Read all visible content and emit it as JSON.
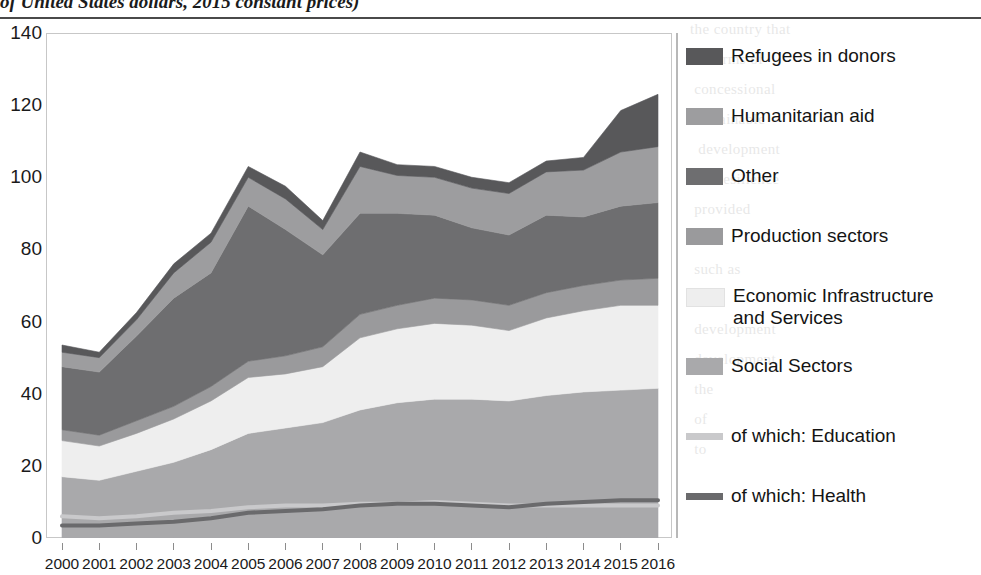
{
  "title": {
    "text": "of United States dollars, 2015 constant prices)",
    "note": "top of title cropped by screenshot edge"
  },
  "axes": {
    "y_ticks": [
      "0",
      "20",
      "40",
      "60",
      "80",
      "100",
      "120",
      "140"
    ],
    "x_ticks": [
      "2000",
      "2001",
      "2002",
      "2003",
      "2004",
      "2005",
      "2006",
      "2007",
      "2008",
      "2009",
      "2010",
      "2011",
      "2012",
      "2013",
      "2014",
      "2015",
      "2016"
    ]
  },
  "legend": {
    "items": [
      {
        "label": "Refugees in donors",
        "type": "area",
        "color": "#58585a"
      },
      {
        "label": "Humanitarian aid",
        "type": "area",
        "color": "#9d9d9f"
      },
      {
        "label": "Other",
        "type": "area",
        "color": "#6e6e70"
      },
      {
        "label": "Production sectors",
        "type": "area",
        "color": "#9a9a9c"
      },
      {
        "label": "Economic Infrastructure\nand Services",
        "type": "area",
        "color": "#eeeeee"
      },
      {
        "label": "Social Sectors",
        "type": "area",
        "color": "#a9a9ab"
      },
      {
        "label": "of which: Education",
        "type": "line",
        "color": "#c9c9cb"
      },
      {
        "label": "of which: Health",
        "type": "line",
        "color": "#6a6a6c"
      }
    ]
  },
  "chart_data": {
    "type": "area",
    "stacked": true,
    "title": "of United States dollars, 2015 constant prices)",
    "xlabel": "",
    "ylabel": "",
    "ylim": [
      0,
      140
    ],
    "grid": false,
    "legend_position": "right",
    "x": [
      2000,
      2001,
      2002,
      2003,
      2004,
      2005,
      2006,
      2007,
      2008,
      2009,
      2010,
      2011,
      2012,
      2013,
      2014,
      2015,
      2016
    ],
    "categories": [
      "2000",
      "2001",
      "2002",
      "2003",
      "2004",
      "2005",
      "2006",
      "2007",
      "2008",
      "2009",
      "2010",
      "2011",
      "2012",
      "2013",
      "2014",
      "2015",
      "2016"
    ],
    "stack_order_bottom_to_top": [
      "Social Sectors",
      "Economic Infrastructure and Services",
      "Production sectors",
      "Other",
      "Humanitarian aid",
      "Refugees in donors"
    ],
    "series": [
      {
        "name": "Social Sectors",
        "color": "#a9a9ab",
        "values": [
          17.0,
          16.0,
          18.5,
          21.0,
          24.5,
          29.0,
          30.5,
          32.0,
          35.5,
          37.5,
          38.5,
          38.5,
          38.0,
          39.5,
          40.5,
          41.0,
          41.5
        ]
      },
      {
        "name": "Economic Infrastructure and Services",
        "color": "#eeeeee",
        "values": [
          10.0,
          9.5,
          10.5,
          12.0,
          13.5,
          15.5,
          15.0,
          15.5,
          20.0,
          20.5,
          21.0,
          20.5,
          19.5,
          21.5,
          22.5,
          23.5,
          23.0
        ]
      },
      {
        "name": "Production sectors",
        "color": "#9a9a9c",
        "values": [
          3.0,
          3.0,
          3.5,
          3.5,
          4.0,
          4.5,
          5.0,
          5.5,
          6.5,
          6.5,
          7.0,
          7.0,
          7.0,
          7.0,
          7.0,
          7.0,
          7.5
        ]
      },
      {
        "name": "Other",
        "color": "#6e6e70",
        "values": [
          17.5,
          17.5,
          23.5,
          30.0,
          31.5,
          43.0,
          35.0,
          25.5,
          28.0,
          25.5,
          23.0,
          20.0,
          19.5,
          21.5,
          19.0,
          20.5,
          21.0
        ]
      },
      {
        "name": "Humanitarian aid",
        "color": "#9d9d9f",
        "values": [
          4.0,
          4.0,
          4.5,
          7.0,
          8.5,
          8.0,
          8.5,
          7.0,
          13.0,
          10.5,
          10.5,
          11.0,
          11.5,
          12.0,
          13.0,
          15.0,
          15.5
        ]
      },
      {
        "name": "Refugees in donors",
        "color": "#58585a",
        "values": [
          2.0,
          1.5,
          2.0,
          2.5,
          2.5,
          3.0,
          3.5,
          2.5,
          4.0,
          3.0,
          3.0,
          3.0,
          3.0,
          3.0,
          3.5,
          11.5,
          14.5
        ]
      }
    ],
    "overlay_lines": [
      {
        "name": "of which: Education",
        "color": "#c9c9cb",
        "values": [
          6.0,
          5.5,
          6.0,
          7.0,
          7.5,
          8.5,
          9.0,
          9.0,
          9.5,
          9.5,
          10.0,
          9.5,
          9.0,
          9.0,
          9.0,
          9.0,
          9.0
        ]
      },
      {
        "name": "of which: Health",
        "color": "#6a6a6c",
        "values": [
          3.5,
          3.5,
          4.0,
          4.5,
          5.5,
          7.0,
          7.5,
          8.0,
          9.0,
          9.5,
          9.5,
          9.0,
          8.5,
          9.5,
          10.0,
          10.5,
          10.5
        ]
      }
    ],
    "totals": [
      53.5,
      51.5,
      62.5,
      76.0,
      84.5,
      103.0,
      97.5,
      88.0,
      107.0,
      103.5,
      103.0,
      100.0,
      98.5,
      104.5,
      105.5,
      118.5,
      123.0
    ]
  },
  "bleed_text": {
    "right_column": "the country that\n in terms of\n concessional\n sustainable\n  development\n the resilience\n provided\n\n such as\n to\n development\n development\n the\n of\n to\n",
    "left_column": ""
  }
}
